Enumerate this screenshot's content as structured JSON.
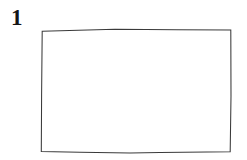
{
  "figure": {
    "label": "1",
    "caption_position": "top-left",
    "background_color": "#ffffff",
    "width": 247,
    "height": 160
  },
  "shape": {
    "name": "rectangle",
    "style": "hand-drawn",
    "fill_color": "#ffffff",
    "stroke_color": "#3a3a3a",
    "stroke_width": 1,
    "contents": "",
    "bounds": {
      "left": 41,
      "top": 29,
      "right": 231,
      "bottom": 152,
      "width": 190,
      "height": 123
    },
    "corners": {
      "top_left": [
        42,
        31
      ],
      "top_mid": [
        115,
        29
      ],
      "top_right": [
        231,
        30
      ],
      "bottom_right": [
        230,
        152
      ],
      "bottom_mid": [
        130,
        153
      ],
      "bottom_left": [
        41,
        151
      ]
    },
    "path": "M 42.2 31.2 L 115 29.2 L 177 29.8 L 230.8 30.1 L 231.0 96 L 230.2 151.8 L 160 152.6 L 130 153.0 L 80 152.2 L 41.3 151.4 L 41.6 95 Z"
  }
}
